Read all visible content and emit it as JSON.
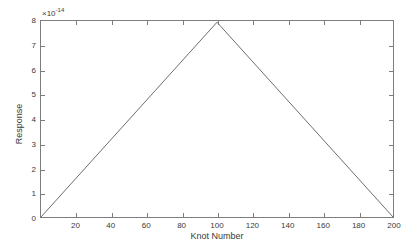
{
  "figure": {
    "background_color": "#ffffff",
    "axis_color": "#7d7d7d",
    "line_color": "#6e6e6e",
    "text_color": "#3a3a3a"
  },
  "chart_data": {
    "type": "line",
    "title": "",
    "xlabel": "Knot Number",
    "ylabel": "Response",
    "y_exponent_label": "×10",
    "y_exponent_value": "-14",
    "y_scale_factor": 1e-14,
    "xlim": [
      0,
      200
    ],
    "ylim": [
      0,
      8
    ],
    "xticks": [
      0,
      20,
      40,
      60,
      80,
      100,
      120,
      140,
      160,
      180,
      200
    ],
    "xticklabels": [
      "",
      "20",
      "40",
      "60",
      "80",
      "100",
      "120",
      "140",
      "160",
      "180",
      "200"
    ],
    "yticks": [
      0,
      1,
      2,
      3,
      4,
      5,
      6,
      7,
      8
    ],
    "yticklabels": [
      "0",
      "1",
      "2",
      "3",
      "4",
      "5",
      "6",
      "7",
      "8"
    ],
    "grid": false,
    "legend": null,
    "series": [
      {
        "name": "Response",
        "x": [
          0,
          100,
          200
        ],
        "y": [
          0,
          7.95,
          0
        ],
        "line_width": 1,
        "marker": "none"
      }
    ]
  }
}
